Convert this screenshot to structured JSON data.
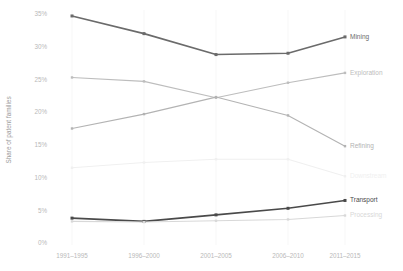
{
  "chart_data": {
    "type": "line",
    "title": "",
    "xlabel": "",
    "ylabel": "Share of patent families",
    "categories": [
      "1991–1995",
      "1996–2000",
      "2001–2005",
      "2006–2010",
      "2011–2015"
    ],
    "ylim": [
      0,
      35
    ],
    "ytick_labels": [
      "0%",
      "5%",
      "10%",
      "15%",
      "20%",
      "25%",
      "30%",
      "35%"
    ],
    "ytick_values": [
      0,
      5,
      10,
      15,
      20,
      25,
      30,
      35
    ],
    "grid": false,
    "legend_position": "right-inline-end-of-line",
    "series": [
      {
        "name": "Mining",
        "label": "Mining",
        "color": "#6b6b6b",
        "values": [
          34.7,
          32.0,
          28.8,
          29.0,
          31.5
        ]
      },
      {
        "name": "Exploration",
        "label": "Exploration",
        "color": "#bdbdbd",
        "values": [
          25.3,
          24.7,
          22.2,
          24.5,
          26.0
        ]
      },
      {
        "name": "Refining",
        "label": "Refining",
        "color": "#b3b3b3",
        "values": [
          17.5,
          19.7,
          22.3,
          19.5,
          14.8
        ]
      },
      {
        "name": "Downstream",
        "label": "Downstream",
        "color": "#f0f0f0",
        "values": [
          11.5,
          12.3,
          12.8,
          12.8,
          10.2
        ]
      },
      {
        "name": "Transport",
        "label": "Transport",
        "color": "#4a4a4a",
        "values": [
          3.8,
          3.3,
          4.3,
          5.3,
          6.5
        ]
      },
      {
        "name": "Processing",
        "label": "Processing",
        "color": "#d8d8d8",
        "values": [
          3.3,
          3.2,
          3.4,
          3.6,
          4.2
        ]
      }
    ]
  }
}
